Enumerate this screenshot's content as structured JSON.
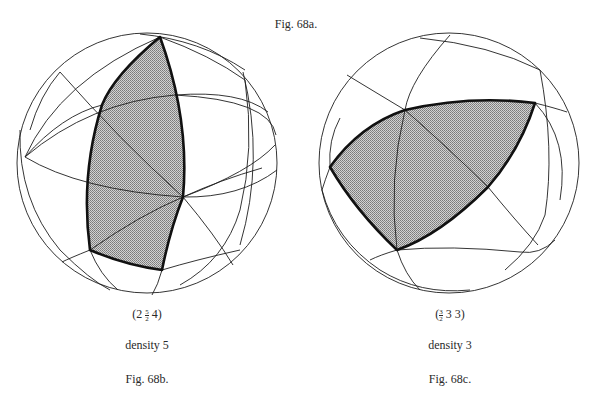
{
  "figure": {
    "top_caption": "Fig. 68a.",
    "panels": [
      {
        "id": "68b",
        "symbol": "(2 5/2 4)",
        "symbol_parts": {
          "open": "(2 ",
          "num": "5",
          "den": "2",
          "close": " 4)"
        },
        "density": "density 5",
        "caption": "Fig. 68b."
      },
      {
        "id": "68c",
        "symbol": "(3/2 3 3)",
        "symbol_parts": {
          "open": "(",
          "num": "3",
          "den": "2",
          "close": " 3 3)"
        },
        "density": "density 3",
        "caption": "Fig. 68c."
      }
    ]
  },
  "colors": {
    "line": "#1e1e1e",
    "outline": "#111111",
    "shade": "#a9a9a9"
  }
}
